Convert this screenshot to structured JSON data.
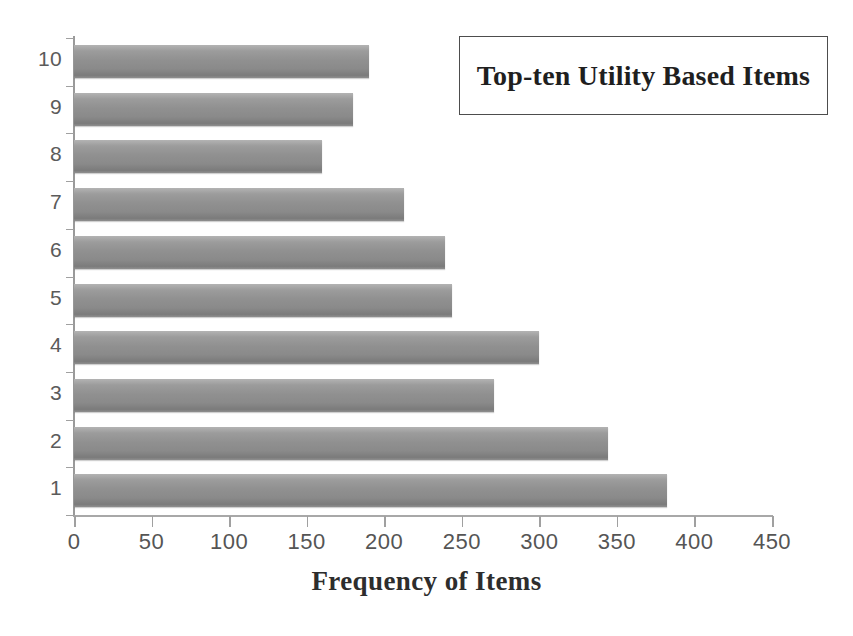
{
  "chart_data": {
    "type": "bar",
    "orientation": "horizontal",
    "title": "Top-ten Utility Based Items",
    "xlabel": "Frequency of Items",
    "ylabel": "",
    "categories": [
      "10",
      "9",
      "8",
      "7",
      "6",
      "5",
      "4",
      "3",
      "2",
      "1"
    ],
    "values": [
      190,
      180,
      160,
      213,
      239,
      244,
      300,
      271,
      344,
      382
    ],
    "xlim": [
      0,
      450
    ],
    "xticks": [
      0,
      50,
      100,
      150,
      200,
      250,
      300,
      350,
      400,
      450
    ],
    "xtick_labels": [
      "0",
      "50",
      "100",
      "150",
      "200",
      "250",
      "300",
      "350",
      "400",
      "450"
    ],
    "ytick_labels": [
      "10",
      "9",
      "8",
      "7",
      "6",
      "5",
      "4",
      "3",
      "2",
      "1"
    ],
    "grid": false,
    "legend_position": "top-right",
    "series": [
      {
        "name": "Top-ten Utility Based Items",
        "values": [
          190,
          180,
          160,
          213,
          239,
          244,
          300,
          271,
          344,
          382
        ]
      }
    ]
  },
  "legend": {
    "label": "Top-ten Utility Based Items"
  },
  "axis": {
    "x_title": "Frequency of Items"
  },
  "colors": {
    "bar_fill": "#8f8f8f",
    "bar_highlight": "#b3b3b3",
    "bar_shadow": "#7b7b7b",
    "axis_line": "#a0a0a0",
    "tick_label": "#555555",
    "title_text": "#1f1f1f",
    "background": "#ffffff"
  }
}
